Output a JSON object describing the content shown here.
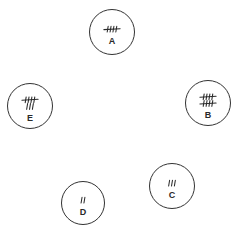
{
  "diagram": {
    "type": "tally-nodes",
    "stroke_color": "#333333",
    "background": "#ffffff",
    "nodes": [
      {
        "id": "A",
        "label": "A",
        "tally": 5,
        "cx": 112,
        "cy": 32,
        "r": 23
      },
      {
        "id": "B",
        "label": "B",
        "tally": 10,
        "cx": 208,
        "cy": 103,
        "r": 23
      },
      {
        "id": "C",
        "label": "C",
        "tally": 3,
        "cx": 172,
        "cy": 186,
        "r": 23
      },
      {
        "id": "D",
        "label": "D",
        "tally": 2,
        "cx": 83,
        "cy": 203,
        "r": 22
      },
      {
        "id": "E",
        "label": "E",
        "tally": 8,
        "cx": 30,
        "cy": 106,
        "r": 23
      }
    ]
  }
}
